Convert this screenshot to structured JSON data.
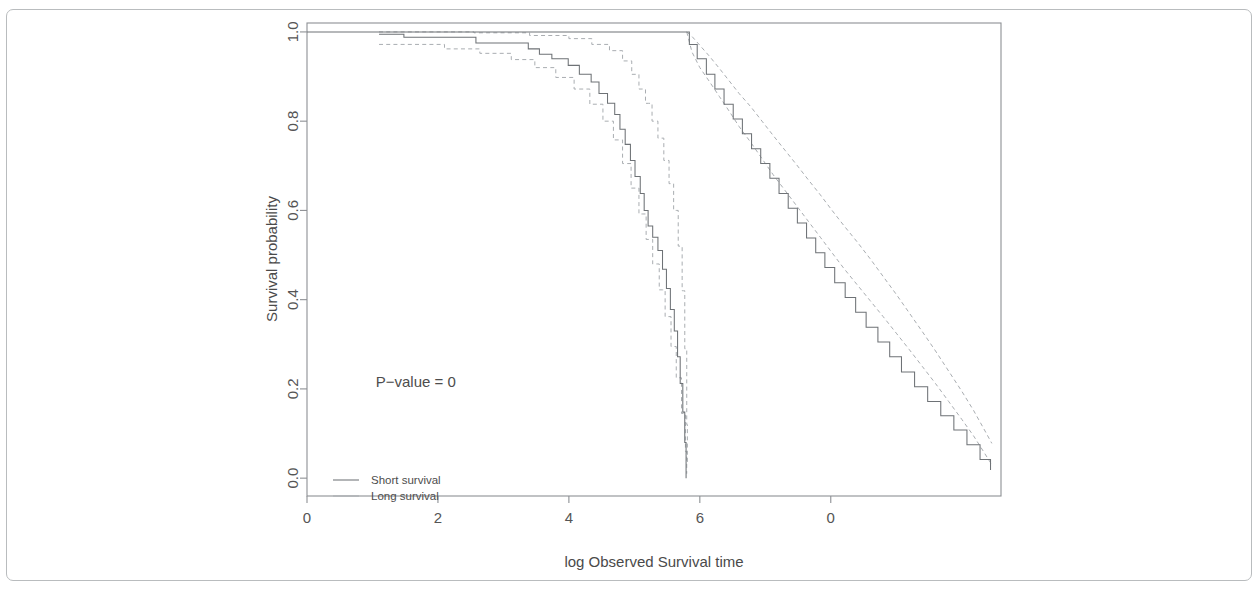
{
  "chart_data": {
    "type": "line",
    "title": "",
    "subtitle": "",
    "xlabel": "log Observed Survival time",
    "ylabel": "Survival probability",
    "xlim": [
      0,
      10.6
    ],
    "ylim": [
      -0.04,
      1.02
    ],
    "xticks": [
      0,
      2,
      4,
      6,
      8
    ],
    "xtick_labels": [
      "0",
      "2",
      "4",
      "6",
      "0"
    ],
    "yticks": [
      0.0,
      0.2,
      0.4,
      0.6,
      0.8,
      1.0
    ],
    "ytick_labels": [
      "0.0",
      "0.2",
      "0.4",
      "0.6",
      "0.8",
      "1.0"
    ],
    "grid": false,
    "legend_position": "bottom-left",
    "annotations": [
      {
        "name": "p-value",
        "text": "P−value = 0",
        "x": 1.05,
        "y": 0.205
      }
    ],
    "series": [
      {
        "name": "Short survival",
        "style": "step-solid",
        "points": [
          [
            1.1,
            0.995
          ],
          [
            1.45,
            0.995
          ],
          [
            1.48,
            0.988
          ],
          [
            2.55,
            0.988
          ],
          [
            2.58,
            0.975
          ],
          [
            3.35,
            0.975
          ],
          [
            3.38,
            0.962
          ],
          [
            3.52,
            0.962
          ],
          [
            3.55,
            0.95
          ],
          [
            3.7,
            0.95
          ],
          [
            3.74,
            0.94
          ],
          [
            3.95,
            0.94
          ],
          [
            3.99,
            0.925
          ],
          [
            4.12,
            0.925
          ],
          [
            4.16,
            0.905
          ],
          [
            4.3,
            0.905
          ],
          [
            4.34,
            0.888
          ],
          [
            4.42,
            0.888
          ],
          [
            4.46,
            0.862
          ],
          [
            4.55,
            0.862
          ],
          [
            4.59,
            0.84
          ],
          [
            4.66,
            0.84
          ],
          [
            4.7,
            0.815
          ],
          [
            4.74,
            0.815
          ],
          [
            4.78,
            0.782
          ],
          [
            4.83,
            0.782
          ],
          [
            4.86,
            0.748
          ],
          [
            4.9,
            0.748
          ],
          [
            4.94,
            0.712
          ],
          [
            4.98,
            0.712
          ],
          [
            5.01,
            0.676
          ],
          [
            5.06,
            0.676
          ],
          [
            5.09,
            0.638
          ],
          [
            5.12,
            0.638
          ],
          [
            5.15,
            0.6
          ],
          [
            5.18,
            0.6
          ],
          [
            5.21,
            0.565
          ],
          [
            5.25,
            0.565
          ],
          [
            5.28,
            0.54
          ],
          [
            5.33,
            0.54
          ],
          [
            5.36,
            0.51
          ],
          [
            5.4,
            0.51
          ],
          [
            5.43,
            0.468
          ],
          [
            5.46,
            0.468
          ],
          [
            5.49,
            0.425
          ],
          [
            5.52,
            0.425
          ],
          [
            5.55,
            0.378
          ],
          [
            5.58,
            0.378
          ],
          [
            5.61,
            0.33
          ],
          [
            5.63,
            0.33
          ],
          [
            5.66,
            0.272
          ],
          [
            5.68,
            0.272
          ],
          [
            5.7,
            0.212
          ],
          [
            5.72,
            0.212
          ],
          [
            5.74,
            0.148
          ],
          [
            5.76,
            0.148
          ],
          [
            5.77,
            0.08
          ],
          [
            5.78,
            0.08
          ],
          [
            5.79,
            0.0
          ]
        ],
        "ci_upper": [
          [
            1.1,
            1.0
          ],
          [
            2.5,
            1.0
          ],
          [
            2.55,
            0.998
          ],
          [
            3.3,
            0.998
          ],
          [
            3.4,
            0.992
          ],
          [
            3.9,
            0.992
          ],
          [
            4.0,
            0.985
          ],
          [
            4.25,
            0.985
          ],
          [
            4.35,
            0.972
          ],
          [
            4.55,
            0.972
          ],
          [
            4.62,
            0.958
          ],
          [
            4.75,
            0.958
          ],
          [
            4.82,
            0.935
          ],
          [
            4.9,
            0.935
          ],
          [
            4.96,
            0.905
          ],
          [
            5.02,
            0.905
          ],
          [
            5.07,
            0.872
          ],
          [
            5.12,
            0.872
          ],
          [
            5.17,
            0.84
          ],
          [
            5.22,
            0.84
          ],
          [
            5.27,
            0.8
          ],
          [
            5.32,
            0.8
          ],
          [
            5.36,
            0.762
          ],
          [
            5.41,
            0.762
          ],
          [
            5.45,
            0.712
          ],
          [
            5.49,
            0.712
          ],
          [
            5.53,
            0.66
          ],
          [
            5.57,
            0.66
          ],
          [
            5.6,
            0.6
          ],
          [
            5.64,
            0.6
          ],
          [
            5.67,
            0.52
          ],
          [
            5.7,
            0.52
          ],
          [
            5.73,
            0.42
          ],
          [
            5.75,
            0.42
          ],
          [
            5.77,
            0.29
          ],
          [
            5.79,
            0.29
          ],
          [
            5.8,
            0.12
          ],
          [
            5.81,
            0.03
          ]
        ],
        "ci_lower": [
          [
            1.1,
            0.972
          ],
          [
            2.05,
            0.972
          ],
          [
            2.1,
            0.962
          ],
          [
            2.58,
            0.962
          ],
          [
            2.64,
            0.952
          ],
          [
            3.05,
            0.952
          ],
          [
            3.12,
            0.938
          ],
          [
            3.4,
            0.938
          ],
          [
            3.48,
            0.92
          ],
          [
            3.72,
            0.92
          ],
          [
            3.8,
            0.898
          ],
          [
            4.0,
            0.898
          ],
          [
            4.08,
            0.872
          ],
          [
            4.25,
            0.872
          ],
          [
            4.32,
            0.838
          ],
          [
            4.45,
            0.838
          ],
          [
            4.52,
            0.8
          ],
          [
            4.62,
            0.8
          ],
          [
            4.68,
            0.758
          ],
          [
            4.76,
            0.758
          ],
          [
            4.82,
            0.705
          ],
          [
            4.9,
            0.705
          ],
          [
            4.95,
            0.65
          ],
          [
            5.02,
            0.65
          ],
          [
            5.07,
            0.592
          ],
          [
            5.13,
            0.592
          ],
          [
            5.18,
            0.535
          ],
          [
            5.24,
            0.535
          ],
          [
            5.28,
            0.48
          ],
          [
            5.34,
            0.48
          ],
          [
            5.38,
            0.422
          ],
          [
            5.43,
            0.422
          ],
          [
            5.47,
            0.362
          ],
          [
            5.52,
            0.362
          ],
          [
            5.56,
            0.295
          ],
          [
            5.6,
            0.295
          ],
          [
            5.64,
            0.225
          ],
          [
            5.68,
            0.225
          ],
          [
            5.72,
            0.145
          ],
          [
            5.75,
            0.145
          ],
          [
            5.78,
            0.06
          ],
          [
            5.8,
            0.01
          ]
        ]
      },
      {
        "name": "Long survival",
        "style": "step-solid",
        "points": [
          [
            0.0,
            1.0
          ],
          [
            5.8,
            1.0
          ],
          [
            5.84,
            0.972
          ],
          [
            5.92,
            0.972
          ],
          [
            5.96,
            0.94
          ],
          [
            6.05,
            0.94
          ],
          [
            6.1,
            0.905
          ],
          [
            6.18,
            0.905
          ],
          [
            6.23,
            0.872
          ],
          [
            6.32,
            0.872
          ],
          [
            6.37,
            0.838
          ],
          [
            6.46,
            0.838
          ],
          [
            6.51,
            0.805
          ],
          [
            6.6,
            0.805
          ],
          [
            6.65,
            0.772
          ],
          [
            6.74,
            0.772
          ],
          [
            6.79,
            0.738
          ],
          [
            6.88,
            0.738
          ],
          [
            6.93,
            0.705
          ],
          [
            7.02,
            0.705
          ],
          [
            7.07,
            0.672
          ],
          [
            7.16,
            0.672
          ],
          [
            7.21,
            0.638
          ],
          [
            7.3,
            0.638
          ],
          [
            7.35,
            0.605
          ],
          [
            7.44,
            0.605
          ],
          [
            7.49,
            0.572
          ],
          [
            7.58,
            0.572
          ],
          [
            7.63,
            0.538
          ],
          [
            7.72,
            0.538
          ],
          [
            7.77,
            0.505
          ],
          [
            7.86,
            0.505
          ],
          [
            7.91,
            0.472
          ],
          [
            8.0,
            0.472
          ],
          [
            8.06,
            0.438
          ],
          [
            8.16,
            0.438
          ],
          [
            8.22,
            0.405
          ],
          [
            8.32,
            0.405
          ],
          [
            8.38,
            0.372
          ],
          [
            8.48,
            0.372
          ],
          [
            8.54,
            0.338
          ],
          [
            8.66,
            0.338
          ],
          [
            8.72,
            0.305
          ],
          [
            8.84,
            0.305
          ],
          [
            8.9,
            0.272
          ],
          [
            9.02,
            0.272
          ],
          [
            9.08,
            0.238
          ],
          [
            9.22,
            0.238
          ],
          [
            9.28,
            0.205
          ],
          [
            9.42,
            0.205
          ],
          [
            9.48,
            0.172
          ],
          [
            9.62,
            0.172
          ],
          [
            9.68,
            0.14
          ],
          [
            9.82,
            0.14
          ],
          [
            9.88,
            0.108
          ],
          [
            10.02,
            0.108
          ],
          [
            10.08,
            0.075
          ],
          [
            10.22,
            0.075
          ],
          [
            10.28,
            0.042
          ],
          [
            10.4,
            0.042
          ],
          [
            10.44,
            0.018
          ]
        ],
        "ci_upper": [
          [
            5.8,
            1.0
          ],
          [
            5.88,
            0.99
          ],
          [
            6.0,
            0.97
          ],
          [
            6.15,
            0.945
          ],
          [
            6.3,
            0.918
          ],
          [
            6.45,
            0.89
          ],
          [
            6.6,
            0.862
          ],
          [
            6.78,
            0.832
          ],
          [
            6.95,
            0.8
          ],
          [
            7.12,
            0.768
          ],
          [
            7.3,
            0.735
          ],
          [
            7.48,
            0.702
          ],
          [
            7.66,
            0.668
          ],
          [
            7.84,
            0.635
          ],
          [
            8.02,
            0.6
          ],
          [
            8.2,
            0.566
          ],
          [
            8.4,
            0.53
          ],
          [
            8.6,
            0.492
          ],
          [
            8.8,
            0.452
          ],
          [
            9.0,
            0.412
          ],
          [
            9.2,
            0.37
          ],
          [
            9.4,
            0.328
          ],
          [
            9.6,
            0.285
          ],
          [
            9.8,
            0.24
          ],
          [
            10.0,
            0.195
          ],
          [
            10.18,
            0.152
          ],
          [
            10.34,
            0.11
          ],
          [
            10.46,
            0.078
          ]
        ],
        "ci_lower": [
          [
            5.8,
            1.0
          ],
          [
            5.88,
            0.955
          ],
          [
            6.0,
            0.92
          ],
          [
            6.15,
            0.888
          ],
          [
            6.3,
            0.855
          ],
          [
            6.45,
            0.822
          ],
          [
            6.6,
            0.788
          ],
          [
            6.78,
            0.752
          ],
          [
            6.95,
            0.716
          ],
          [
            7.12,
            0.68
          ],
          [
            7.3,
            0.645
          ],
          [
            7.48,
            0.61
          ],
          [
            7.66,
            0.575
          ],
          [
            7.84,
            0.54
          ],
          [
            8.02,
            0.505
          ],
          [
            8.2,
            0.47
          ],
          [
            8.4,
            0.434
          ],
          [
            8.6,
            0.398
          ],
          [
            8.8,
            0.362
          ],
          [
            9.0,
            0.325
          ],
          [
            9.2,
            0.288
          ],
          [
            9.4,
            0.25
          ],
          [
            9.6,
            0.212
          ],
          [
            9.8,
            0.172
          ],
          [
            10.0,
            0.132
          ],
          [
            10.18,
            0.095
          ],
          [
            10.34,
            0.058
          ],
          [
            10.46,
            0.03
          ]
        ]
      }
    ],
    "legend": [
      {
        "label": "Short survival",
        "style": "solid"
      },
      {
        "label": "Long survival",
        "style": "solid-light"
      }
    ]
  }
}
